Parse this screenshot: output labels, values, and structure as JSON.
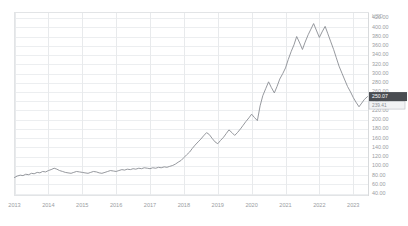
{
  "chart_data": {
    "type": "line",
    "title": "",
    "subtitle": "",
    "xlabel": "",
    "ylabel": "",
    "unit_label": "USD",
    "grid": true,
    "legend": "none",
    "series_color": "#8a8d93",
    "xlim": [
      2013.0,
      2023.45
    ],
    "ylim": [
      36,
      432
    ],
    "y_ticks": [
      "420.00",
      "400.00",
      "380.00",
      "360.00",
      "340.00",
      "320.00",
      "300.00",
      "280.00",
      "260.00",
      "240.00",
      "220.00",
      "200.00",
      "180.00",
      "160.00",
      "140.00",
      "120.00",
      "100.00",
      "80.00",
      "60.00",
      "40.00"
    ],
    "y_tick_values": [
      420,
      400,
      380,
      360,
      340,
      320,
      300,
      280,
      260,
      240,
      220,
      200,
      180,
      160,
      140,
      120,
      100,
      80,
      60,
      40
    ],
    "x_ticks": [
      "2013",
      "2014",
      "2015",
      "2016",
      "2017",
      "2018",
      "2019",
      "2020",
      "2021",
      "2022",
      "2023"
    ],
    "x_tick_values": [
      2013,
      2014,
      2015,
      2016,
      2017,
      2018,
      2019,
      2020,
      2021,
      2022,
      2023
    ],
    "price_marker": {
      "value": "250.07",
      "secondary": "239.41",
      "y_value": 250.07,
      "color": "#4a4d52"
    },
    "x": [
      2013.0,
      2013.08,
      2013.17,
      2013.25,
      2013.33,
      2013.42,
      2013.5,
      2013.58,
      2013.67,
      2013.75,
      2013.83,
      2013.92,
      2014.0,
      2014.08,
      2014.17,
      2014.25,
      2014.33,
      2014.42,
      2014.5,
      2014.58,
      2014.67,
      2014.75,
      2014.83,
      2014.92,
      2015.0,
      2015.08,
      2015.17,
      2015.25,
      2015.33,
      2015.42,
      2015.5,
      2015.58,
      2015.67,
      2015.75,
      2015.83,
      2015.92,
      2016.0,
      2016.08,
      2016.17,
      2016.25,
      2016.33,
      2016.42,
      2016.5,
      2016.58,
      2016.67,
      2016.75,
      2016.83,
      2016.92,
      2017.0,
      2017.08,
      2017.17,
      2017.25,
      2017.33,
      2017.42,
      2017.5,
      2017.58,
      2017.67,
      2017.75,
      2017.83,
      2017.92,
      2018.0,
      2018.08,
      2018.17,
      2018.25,
      2018.33,
      2018.42,
      2018.5,
      2018.58,
      2018.67,
      2018.75,
      2018.83,
      2018.92,
      2019.0,
      2019.08,
      2019.17,
      2019.25,
      2019.33,
      2019.42,
      2019.5,
      2019.58,
      2019.67,
      2019.75,
      2019.83,
      2019.92,
      2020.0,
      2020.08,
      2020.17,
      2020.25,
      2020.33,
      2020.42,
      2020.5,
      2020.58,
      2020.67,
      2020.75,
      2020.83,
      2020.92,
      2021.0,
      2021.08,
      2021.17,
      2021.25,
      2021.33,
      2021.42,
      2021.5,
      2021.58,
      2021.67,
      2021.75,
      2021.83,
      2021.92,
      2022.0,
      2022.08,
      2022.17,
      2022.25,
      2022.33,
      2022.42,
      2022.5,
      2022.58,
      2022.67,
      2022.75,
      2022.83,
      2022.92,
      2023.0,
      2023.08,
      2023.17,
      2023.25,
      2023.33,
      2023.42
    ],
    "values": [
      75,
      78,
      80,
      79,
      82,
      81,
      84,
      83,
      86,
      85,
      88,
      87,
      90,
      92,
      95,
      93,
      90,
      88,
      86,
      85,
      84,
      86,
      88,
      87,
      86,
      85,
      84,
      86,
      88,
      87,
      85,
      84,
      86,
      88,
      90,
      89,
      88,
      90,
      92,
      91,
      93,
      92,
      94,
      93,
      95,
      94,
      96,
      95,
      94,
      96,
      95,
      97,
      96,
      98,
      97,
      99,
      101,
      104,
      108,
      112,
      118,
      124,
      130,
      138,
      145,
      152,
      158,
      165,
      172,
      168,
      160,
      152,
      148,
      155,
      162,
      170,
      178,
      172,
      166,
      172,
      180,
      188,
      196,
      204,
      212,
      205,
      198,
      230,
      252,
      268,
      282,
      270,
      258,
      272,
      288,
      300,
      312,
      330,
      348,
      362,
      380,
      366,
      352,
      368,
      384,
      396,
      408,
      392,
      378,
      390,
      402,
      386,
      370,
      352,
      334,
      316,
      300,
      286,
      272,
      260,
      248,
      238,
      228,
      236,
      244,
      250
    ]
  }
}
